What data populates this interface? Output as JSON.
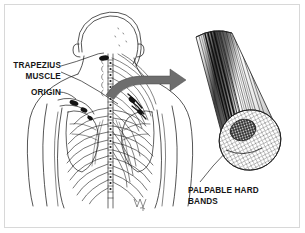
{
  "figure": {
    "background_color": "#ffffff",
    "border_color": "#d8d8d8",
    "ink_color": "#161616",
    "arrow_color": "#6e6e6e"
  },
  "labels": {
    "trapezius_muscle": "TRAPEZIUS\nMUSCLE",
    "origin": "ORIGIN",
    "palpable_hard_bands": "PALPABLE HARD\nBANDS"
  },
  "illustration": {
    "left_panel_name": "posterior-upper-back-anatomy",
    "right_panel_name": "magnified-muscle-bundle-cylinder",
    "arrow_name": "magnification-arrow",
    "signature_name": "illustrator-signature"
  }
}
